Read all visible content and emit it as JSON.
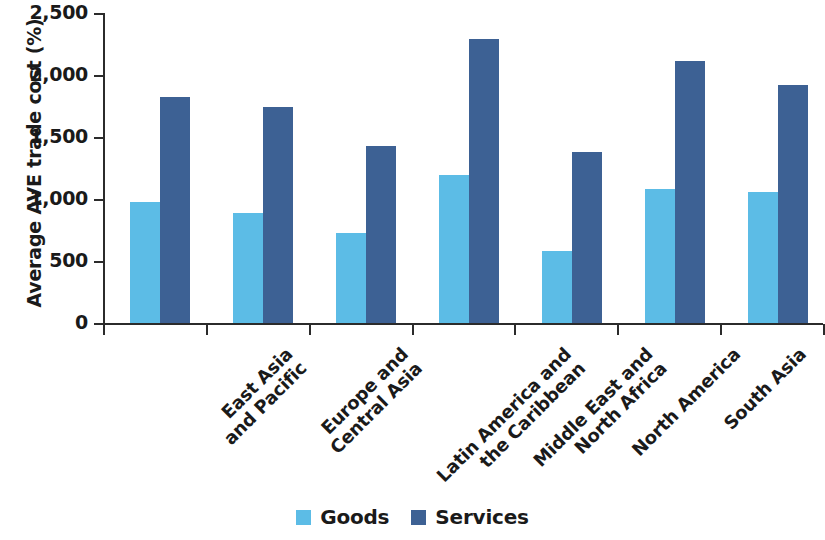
{
  "chart_data": {
    "type": "bar",
    "title": "",
    "xlabel": "",
    "ylabel": "Average AVE trade cost (%)",
    "ylim": [
      0,
      2500
    ],
    "yticks": [
      0,
      500,
      1000,
      1500,
      2000,
      2500
    ],
    "ytick_labels": [
      "0",
      "500",
      "1,000",
      "1,500",
      "2,000",
      "2,500"
    ],
    "grid": false,
    "legend_position": "bottom-center",
    "categories": [
      "East Asia and Pacific",
      "Europe and Central Asia",
      "Latin America and the Caribbean",
      "Middle East and North Africa",
      "North America",
      "South Asia",
      "Sub-Saharan Africa"
    ],
    "category_lines": [
      [
        "East Asia",
        "and Pacific"
      ],
      [
        "Europe and",
        "Central Asia"
      ],
      [
        "Latin America and",
        "the Caribbean"
      ],
      [
        "Middle East and",
        "North Africa"
      ],
      [
        "North America"
      ],
      [
        "South Asia"
      ],
      [
        "Sub-Saharan",
        "Africa"
      ]
    ],
    "series": [
      {
        "name": "Goods",
        "color": "#5cbce6",
        "values": [
          975,
          885,
          725,
          1195,
          580,
          1080,
          1055
        ]
      },
      {
        "name": "Services",
        "color": "#3d6194",
        "values": [
          1820,
          1740,
          1425,
          2290,
          1380,
          2115,
          1920
        ]
      }
    ]
  },
  "legend": {
    "entries": [
      {
        "label": "Goods"
      },
      {
        "label": "Services"
      }
    ]
  }
}
